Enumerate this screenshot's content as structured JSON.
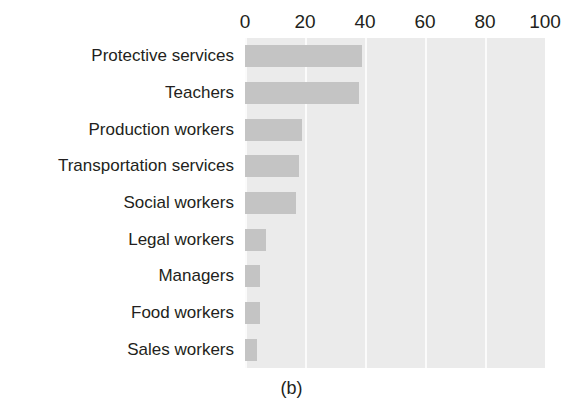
{
  "caption": "(b)",
  "chart_data": {
    "type": "bar",
    "orientation": "horizontal",
    "title": "",
    "xlabel": "",
    "ylabel": "",
    "xlim": [
      0,
      100
    ],
    "xticks": [
      0,
      20,
      40,
      60,
      80,
      100
    ],
    "xtick_labels": [
      "0",
      "20",
      "40",
      "60",
      "80",
      "100"
    ],
    "grid": true,
    "grid_axis": "x",
    "legend": false,
    "axis_position": "top",
    "categories": [
      "Protective services",
      "Teachers",
      "Production workers",
      "Transportation services",
      "Social workers",
      "Legal workers",
      "Managers",
      "Food workers",
      "Sales workers"
    ],
    "values": [
      39,
      38,
      19,
      18,
      17,
      7,
      5,
      5,
      4
    ],
    "colors": {
      "bar": "#c4c4c4",
      "plot_background": "#ebebeb",
      "gridline": "#fbfbfb",
      "text": "#231f20",
      "figure_background": "#ffffff"
    }
  }
}
